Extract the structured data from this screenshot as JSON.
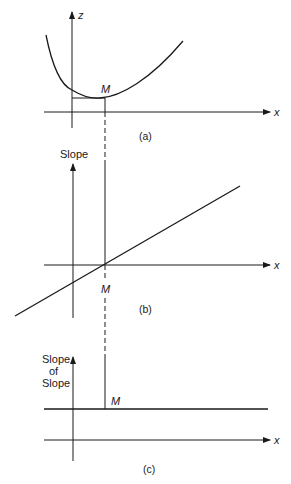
{
  "panels": {
    "a": {
      "caption": "(a)",
      "y_axis_label": "z",
      "x_axis_label": "x",
      "point_label": "M",
      "description": "U-shaped curve of z versus x with minimum at M"
    },
    "b": {
      "caption": "(b)",
      "y_axis_label": "Slope",
      "x_axis_label": "x",
      "point_label": "M",
      "description": "Slope of curve is a rising straight line crossing zero at M"
    },
    "c": {
      "caption": "(c)",
      "y_axis_label_line1": "Slope",
      "y_axis_label_line2": "of",
      "y_axis_label_line3": "Slope",
      "x_axis_label": "x",
      "point_label": "M",
      "description": "Slope of slope is a positive constant horizontal line"
    }
  },
  "colors": {
    "ink": "#1a1a1a",
    "background": "#ffffff"
  }
}
